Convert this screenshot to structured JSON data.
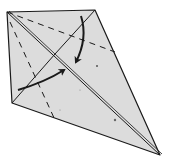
{
  "diagram": {
    "type": "origami-folding-step",
    "colors": {
      "paper": "#dcdcdc",
      "line": "#1a1a1a",
      "background": "#ffffff"
    },
    "arrows": [
      {
        "name": "fold-arrow-top",
        "direction": "down-left"
      },
      {
        "name": "fold-arrow-left",
        "direction": "up-right"
      }
    ],
    "lines": {
      "dashed": [
        "valley-fold-top",
        "valley-fold-left"
      ],
      "solid": [
        "center-crease",
        "flap-edge"
      ]
    }
  }
}
